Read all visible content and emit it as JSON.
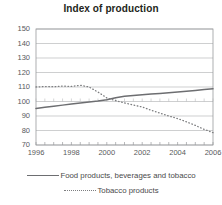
{
  "chart_data": {
    "type": "line",
    "title": "Index of production",
    "xlabel": "",
    "ylabel": "",
    "xlim": [
      1996,
      2006
    ],
    "ylim": [
      70,
      150
    ],
    "grid": true,
    "legend_position": "bottom",
    "y_ticks": [
      150,
      140,
      130,
      120,
      110,
      100,
      90,
      80,
      70
    ],
    "x_ticks": [
      1996,
      1998,
      2000,
      2002,
      2004,
      2006
    ],
    "x": [
      1996,
      1996.5,
      1997,
      1997.5,
      1998,
      1998.5,
      1999,
      1999.5,
      2000,
      2000.5,
      2001,
      2001.5,
      2002,
      2002.5,
      2003,
      2003.5,
      2004,
      2004.5,
      2005,
      2005.5,
      2006
    ],
    "series": [
      {
        "name": "Food products, beverages and tobacco",
        "style": "solid",
        "color": "#6d6e71",
        "values": [
          95.2,
          96.0,
          96.8,
          97.5,
          98.2,
          98.9,
          99.6,
          100.3,
          101.2,
          102.6,
          103.6,
          104.2,
          104.7,
          105.2,
          105.6,
          106.1,
          106.6,
          107.1,
          107.6,
          108.2,
          108.8
        ]
      },
      {
        "name": "Tobacco products",
        "style": "dotted",
        "color": "#7d7e80",
        "values": [
          110.0,
          110.3,
          110.2,
          110.6,
          110.4,
          111.2,
          110.0,
          106.5,
          102.5,
          100.6,
          99.0,
          97.6,
          96.2,
          94.0,
          92.0,
          90.0,
          88.2,
          86.0,
          83.5,
          80.8,
          78.5
        ]
      }
    ]
  },
  "legend": {
    "entries": [
      {
        "label": "Food products, beverages and tobacco",
        "style": "solid"
      },
      {
        "label": "Tobacco products",
        "style": "dotted"
      }
    ]
  }
}
